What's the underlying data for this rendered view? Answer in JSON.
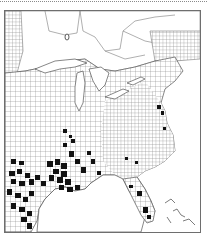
{
  "map": {
    "type": "county-distribution",
    "region": "Eastern United States and southeastern Canada",
    "legend": "none shown",
    "colors": {
      "present": "#111111",
      "absent": "#ffffff",
      "county_lines": "#7a7a7a",
      "frame": "#6e6e6e",
      "water": "#ffffff"
    },
    "presence_regions": [
      "East Texas",
      "Louisiana",
      "Mississippi",
      "Alabama",
      "Arkansas (south)",
      "Tennessee (scattered)",
      "Florida (central and southern)",
      "Virginia / Chesapeake (scattered)",
      "Illinois / Indiana (scattered)"
    ]
  }
}
